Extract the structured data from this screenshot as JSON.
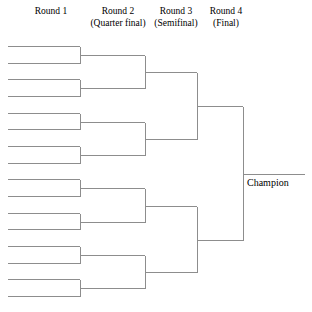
{
  "headers": [
    {
      "line1": "Round 1",
      "line2": ""
    },
    {
      "line1": "Round 2",
      "line2": "(Quarter final)"
    },
    {
      "line1": "Round 3",
      "line2": "(Semifinal)"
    },
    {
      "line1": "Round 4",
      "line2": "(Final)"
    }
  ],
  "champion": {
    "label": "Champion"
  },
  "chart_data": {
    "type": "diagram",
    "title": "",
    "diagram_kind": "single-elimination-tournament-bracket",
    "entrants": 16,
    "rounds": [
      {
        "name": "Round 1",
        "subtitle": "",
        "matches": 8,
        "slots": 16
      },
      {
        "name": "Round 2",
        "subtitle": "(Quarter final)",
        "matches": 4,
        "slots": 8
      },
      {
        "name": "Round 3",
        "subtitle": "(Semifinal)",
        "matches": 2,
        "slots": 4
      },
      {
        "name": "Round 4",
        "subtitle": "(Final)",
        "matches": 1,
        "slots": 2
      }
    ],
    "outcome_label": "Champion",
    "line_color": "#8d8d8d",
    "background_color": "#ffffff",
    "geometry": {
      "round1": {
        "x_start": 8,
        "x_end": 80,
        "y_first": 46,
        "y_step": 16.67,
        "count": 16
      },
      "round2": {
        "x_start": 80,
        "x_end": 145,
        "count": 8
      },
      "round3": {
        "x_start": 145,
        "x_end": 197,
        "count": 4
      },
      "round4": {
        "x_start": 197,
        "x_end": 243,
        "count": 2
      },
      "champion_line": {
        "x_start": 243,
        "x_end": 305,
        "y": 172
      }
    }
  }
}
